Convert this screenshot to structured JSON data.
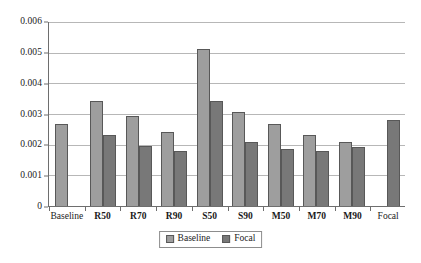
{
  "chart_data": {
    "type": "bar",
    "title": "",
    "subtitle": "",
    "xlabel": "",
    "ylabel": "",
    "categories": [
      "Baseline",
      "R50",
      "R70",
      "R90",
      "S50",
      "S90",
      "M50",
      "M70",
      "M90",
      "Focal"
    ],
    "series": [
      {
        "name": "Baseline",
        "color": "#9e9e9e",
        "values": [
          0.00266,
          0.00341,
          0.00294,
          0.00242,
          0.00513,
          0.00306,
          0.00268,
          0.00232,
          0.00209,
          null
        ]
      },
      {
        "name": "Focal",
        "color": "#787878",
        "values": [
          null,
          0.00232,
          0.00196,
          0.00181,
          0.00344,
          0.00209,
          0.00185,
          0.00181,
          0.00192,
          0.00282
        ]
      }
    ],
    "ylim": [
      0,
      0.006
    ],
    "ytick_values": [
      0,
      0.001,
      0.002,
      0.003,
      0.004,
      0.005,
      0.006
    ],
    "ytick_labels": [
      "0",
      "0.001",
      "0.002",
      "0.003",
      "0.004",
      "0.005",
      "0.006"
    ],
    "grid": "horizontal",
    "legend_position": "bottom-center",
    "legend_entries": [
      "Baseline",
      "Focal"
    ],
    "bold_category_labels": [
      "R50",
      "R70",
      "R90",
      "S50",
      "S90",
      "M50",
      "M70",
      "M90"
    ]
  }
}
